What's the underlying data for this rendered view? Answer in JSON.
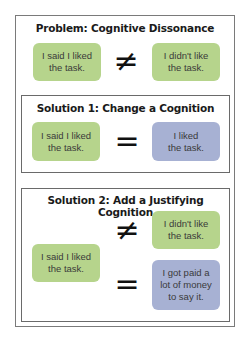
{
  "problem": {
    "title": "Problem: Cognitive Dissonance",
    "left": "I said I liked\nthe task.",
    "symbol": "≠",
    "right": "I didn't like\nthe task."
  },
  "solution1": {
    "title": "Solution 1: Change a Cognition",
    "left": "I said I liked\nthe task.",
    "symbol": "=",
    "right": "I liked\nthe task."
  },
  "solution2": {
    "title": "Solution 2: Add a Justifying Cognition",
    "left": "I said I liked\nthe task.",
    "symbol_top": "≠",
    "right_top": "I didn't like\nthe task.",
    "symbol_bottom": "=",
    "right_bottom": "I got paid a\nlot of money\nto say it."
  },
  "colors": {
    "green": "#b6d48c",
    "blue": "#a7b1d3"
  }
}
